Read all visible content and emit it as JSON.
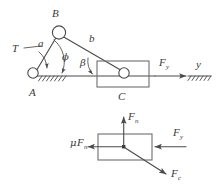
{
  "figure": {
    "background_color": "#ffffff",
    "line_color": "#4a4a4a",
    "box_color": "#6e6e74",
    "label_color": "#3a3a3a"
  },
  "mechanism": {
    "name": "slider-crank mechanism",
    "labels": {
      "pivot_a": "A",
      "joint_b": "B",
      "slider_c": "C",
      "link_a": "a",
      "link_b": "b",
      "torque": "T",
      "angle_phi": "ϕ",
      "angle_beta": "β",
      "force_f": "F",
      "force_f_sub": "y",
      "axis_y": "y"
    }
  },
  "free_body": {
    "name": "free-body diagram of slider",
    "labels": {
      "normal_force": "F",
      "normal_force_sub": "n",
      "friction_mu": "μ",
      "friction_force": "F",
      "friction_force_sub": "n",
      "applied_force": "F",
      "applied_force_sub": "y",
      "connecting_force": "F",
      "connecting_force_sub": "c"
    }
  }
}
